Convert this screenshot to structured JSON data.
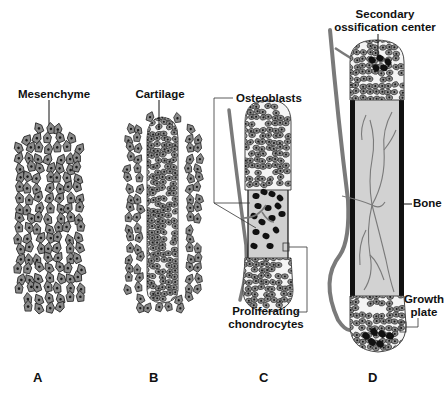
{
  "figure": {
    "panels": [
      {
        "letter": "A",
        "label": "Mesenchyme"
      },
      {
        "letter": "B",
        "label": "Cartilage"
      },
      {
        "letter": "C",
        "labels": [
          "Osteoblasts",
          "Proliferating chondrocytes"
        ]
      },
      {
        "letter": "D",
        "labels": [
          "Secondary ossification center",
          "Bone",
          "Growth plate"
        ]
      }
    ],
    "labels": {
      "mesenchyme": "Mesenchyme",
      "cartilage": "Cartilage",
      "osteoblasts": "Osteoblasts",
      "proliferating_line1": "Proliferating",
      "proliferating_line2": "chondrocytes",
      "secondary_line1": "Secondary",
      "secondary_line2": "ossification center",
      "bone": "Bone",
      "growth_line1": "Growth",
      "growth_line2": "plate"
    },
    "letters": {
      "a": "A",
      "b": "B",
      "c": "C",
      "d": "D"
    },
    "colors": {
      "cell_fill": "#8a8a8a",
      "cell_stroke": "#222222",
      "nucleus": "#1a1a1a",
      "matrix": "#d8d8d8",
      "bone_cortex": "#111111",
      "vessel": "#7a7a7a",
      "osteoblast": "#111111",
      "text": "#111111"
    }
  }
}
